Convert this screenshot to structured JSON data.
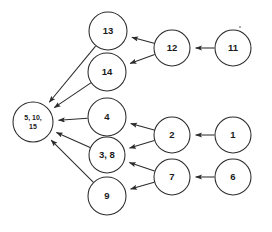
{
  "diagram": {
    "background_color": "#ffffff",
    "node_stroke_color": "#2b2b2b",
    "node_fill_color": "#ffffff",
    "edge_color": "#2b2b2b",
    "label_color": "#1a1a1a"
  },
  "chart_data": {
    "type": "diagram",
    "layout": "left-pointing directed acyclic graph, four columns",
    "nodes": [
      {
        "id": "hub",
        "label_line1": "5, 10,",
        "label_line2": "15",
        "label": "5, 10, 15",
        "cx": 33,
        "cy": 122,
        "r": 20,
        "font_size": 7,
        "multiline": true,
        "column": 0
      },
      {
        "id": "n13",
        "label": "13",
        "cx": 108,
        "cy": 31,
        "r": 19,
        "font_size": 9.5,
        "multiline": false,
        "column": 1
      },
      {
        "id": "n14",
        "label": "14",
        "cx": 107,
        "cy": 72,
        "r": 19,
        "font_size": 9.5,
        "multiline": false,
        "column": 1
      },
      {
        "id": "n4",
        "label": "4",
        "cx": 107,
        "cy": 117,
        "r": 19,
        "font_size": 9.5,
        "multiline": false,
        "column": 1
      },
      {
        "id": "n38",
        "label": "3, 8",
        "cx": 107,
        "cy": 155,
        "r": 18,
        "font_size": 9.5,
        "multiline": false,
        "column": 1
      },
      {
        "id": "n9",
        "label": "9",
        "cx": 107,
        "cy": 196,
        "r": 19,
        "font_size": 9.5,
        "multiline": false,
        "column": 1
      },
      {
        "id": "n12",
        "label": "12",
        "cx": 172,
        "cy": 48,
        "r": 18,
        "font_size": 9.5,
        "multiline": false,
        "column": 2
      },
      {
        "id": "n2",
        "label": "2",
        "cx": 172,
        "cy": 135,
        "r": 18,
        "font_size": 9.5,
        "multiline": false,
        "column": 2
      },
      {
        "id": "n7",
        "label": "7",
        "cx": 172,
        "cy": 177,
        "r": 18,
        "font_size": 9.5,
        "multiline": false,
        "column": 2
      },
      {
        "id": "n11",
        "label": "11",
        "cx": 233,
        "cy": 48,
        "r": 18,
        "font_size": 9.5,
        "multiline": false,
        "column": 3
      },
      {
        "id": "n1",
        "label": "1",
        "cx": 233,
        "cy": 135,
        "r": 18,
        "font_size": 9.5,
        "multiline": false,
        "column": 3
      },
      {
        "id": "n6",
        "label": "6",
        "cx": 233,
        "cy": 177,
        "r": 18,
        "font_size": 9.5,
        "multiline": false,
        "column": 3
      }
    ],
    "edges": [
      {
        "from": "n11",
        "to": "n12",
        "directed": true
      },
      {
        "from": "n12",
        "to": "n13",
        "directed": true
      },
      {
        "from": "n12",
        "to": "n14",
        "directed": true
      },
      {
        "from": "n13",
        "to": "hub",
        "directed": true
      },
      {
        "from": "n14",
        "to": "hub",
        "directed": true
      },
      {
        "from": "n1",
        "to": "n2",
        "directed": true
      },
      {
        "from": "n2",
        "to": "n4",
        "directed": true
      },
      {
        "from": "n2",
        "to": "n38",
        "directed": true
      },
      {
        "from": "n4",
        "to": "hub",
        "directed": true
      },
      {
        "from": "n38",
        "to": "hub",
        "directed": true
      },
      {
        "from": "n6",
        "to": "n7",
        "directed": true
      },
      {
        "from": "n7",
        "to": "n38",
        "directed": true
      },
      {
        "from": "n7",
        "to": "n9",
        "directed": true
      },
      {
        "from": "n9",
        "to": "hub",
        "directed": true
      }
    ],
    "specks": [
      {
        "cx": 240,
        "cy": 27,
        "r": 1.1
      }
    ]
  }
}
